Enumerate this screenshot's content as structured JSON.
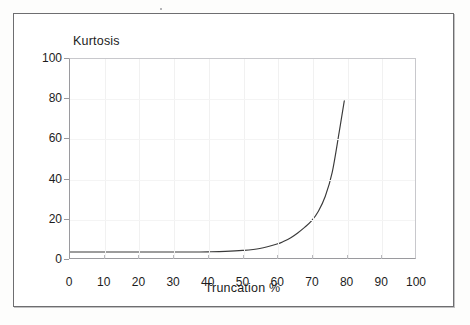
{
  "chart_data": {
    "type": "line",
    "title": "",
    "ylabel": "Kurtosis",
    "xlabel": "Truncation %",
    "xlim": [
      0,
      100
    ],
    "ylim": [
      0,
      100
    ],
    "xticks": [
      0,
      10,
      20,
      30,
      40,
      50,
      60,
      70,
      80,
      90,
      100
    ],
    "yticks": [
      0,
      20,
      40,
      60,
      80,
      100
    ],
    "grid": false,
    "legend": null,
    "series": [
      {
        "name": "Kurtosis vs Truncation",
        "color": "#3a3a3a",
        "x": [
          0,
          5,
          10,
          15,
          20,
          25,
          30,
          35,
          40,
          45,
          50,
          55,
          60,
          62,
          64,
          66,
          68,
          70,
          72,
          74,
          76,
          78,
          79.5
        ],
        "values": [
          3.0,
          3.0,
          3.0,
          3.0,
          3.0,
          3.0,
          3.0,
          3.0,
          3.1,
          3.3,
          3.8,
          4.8,
          7.0,
          8.4,
          10.2,
          12.6,
          15.4,
          18.6,
          23.5,
          31.0,
          43.0,
          63.0,
          79.0
        ]
      }
    ]
  },
  "axes": {
    "y_title": "Kurtosis",
    "x_title": "Truncation %",
    "y_tick_labels": [
      "100",
      "80",
      "60",
      "40",
      "20",
      "0"
    ],
    "x_tick_labels": [
      "0",
      "10",
      "20",
      "30",
      "40",
      "50",
      "60",
      "70",
      "80",
      "90",
      "100"
    ]
  },
  "colors": {
    "curve": "#3a3a3a",
    "axis": "#9a9a9e",
    "frame": "#6e6e70",
    "text": "#1c1c1c",
    "background": "#ffffff"
  }
}
